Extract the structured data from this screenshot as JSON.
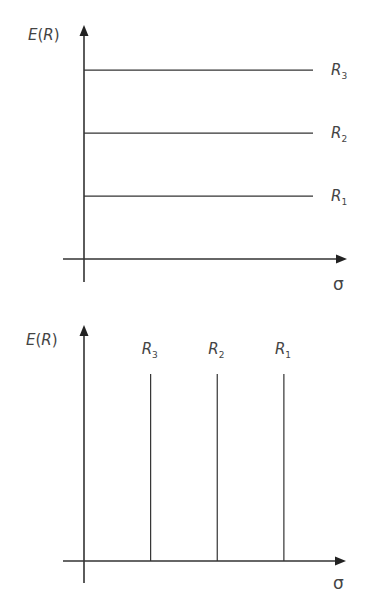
{
  "chart_data": [
    {
      "type": "line",
      "title": "",
      "ylabel": "E(R)",
      "xlabel": "σ",
      "description": "Three horizontal lines of constant expected return at different levels",
      "series": [
        {
          "name": "R3",
          "label_main": "R",
          "label_sub": "3",
          "orientation": "horizontal",
          "level": 3
        },
        {
          "name": "R2",
          "label_main": "R",
          "label_sub": "2",
          "orientation": "horizontal",
          "level": 2
        },
        {
          "name": "R1",
          "label_main": "R",
          "label_sub": "1",
          "orientation": "horizontal",
          "level": 1
        }
      ],
      "ylim": [
        0,
        3.7
      ],
      "grid": false
    },
    {
      "type": "line",
      "title": "",
      "ylabel": "E(R)",
      "xlabel": "σ",
      "description": "Three vertical lines of constant risk at different levels",
      "series": [
        {
          "name": "R3",
          "label_main": "R",
          "label_sub": "3",
          "orientation": "vertical",
          "level": 1
        },
        {
          "name": "R2",
          "label_main": "R",
          "label_sub": "2",
          "orientation": "vertical",
          "level": 2
        },
        {
          "name": "R1",
          "label_main": "R",
          "label_sub": "1",
          "orientation": "vertical",
          "level": 3
        }
      ],
      "xlim": [
        0,
        4
      ],
      "grid": false
    }
  ]
}
